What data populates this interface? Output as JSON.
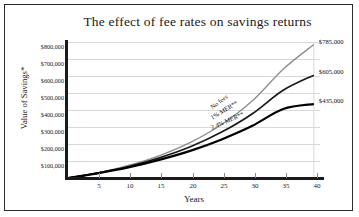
{
  "chart_data": {
    "type": "line",
    "title": "The effect of fee rates on savings returns",
    "xlabel": "Years",
    "ylabel": "Value of Savings*",
    "xlim": [
      0,
      41
    ],
    "ylim": [
      0,
      800000
    ],
    "grid": true,
    "legend_position": "inline-on-curves",
    "x_ticks": [
      5,
      10,
      15,
      20,
      25,
      30,
      35,
      40
    ],
    "x_tick_labels": [
      "5",
      "10",
      "15",
      "20",
      "25",
      "30",
      "35",
      "40"
    ],
    "y_ticks": [
      100000,
      200000,
      300000,
      400000,
      500000,
      600000,
      700000,
      800000
    ],
    "y_tick_labels": [
      "$100,000",
      "$200,000",
      "$300,000",
      "$400,000",
      "$500,000",
      "$600,000",
      "$700,000",
      "$800,000"
    ],
    "x": [
      0,
      5,
      10,
      15,
      20,
      25,
      30,
      35,
      40
    ],
    "series": [
      {
        "name": "No fees",
        "inline_label": "No fees",
        "end_label": "$785,000",
        "color": "#8c8c8c",
        "values": [
          0,
          32000,
          75000,
          133000,
          211000,
          315000,
          454000,
          640000,
          785000
        ]
      },
      {
        "name": "1% MER**",
        "inline_label": "1% MER**",
        "end_label": "$605,000",
        "color": "#1a1a1a",
        "values": [
          0,
          30000,
          69000,
          120000,
          185000,
          270000,
          378000,
          516000,
          605000
        ]
      },
      {
        "name": "2.4% MER**",
        "inline_label": "2.4% MER**",
        "end_label": "$435,000",
        "color": "#000000",
        "values": [
          0,
          29000,
          64000,
          108000,
          161000,
          227000,
          307000,
          406000,
          435000
        ]
      }
    ]
  },
  "figure": {
    "title": "The effect of fee rates on savings returns",
    "x_axis_title": "Years",
    "y_axis_title": "Value of Savings*"
  }
}
